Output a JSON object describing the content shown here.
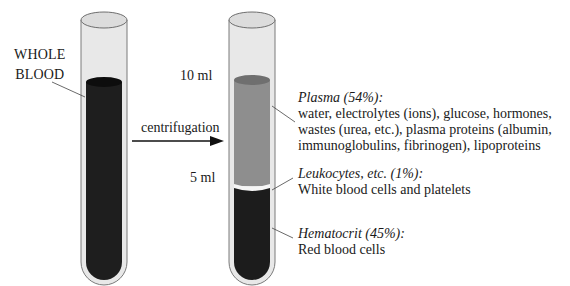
{
  "whole_blood_label": [
    "WHOLE",
    "BLOOD"
  ],
  "arrow_label": "centrifugation",
  "scale": {
    "top": "10 ml",
    "mid": "5 ml"
  },
  "layers": [
    {
      "title": "Plasma (54%):",
      "lines": [
        "water, electrolytes (ions), glucose, hormones,",
        "wastes (urea, etc.), plasma proteins (albumin,",
        "immunoglobulins, fibrinogen), lipoproteins"
      ],
      "color": "#8e8e8e"
    },
    {
      "title": "Leukocytes, etc. (1%):",
      "lines": [
        "White blood cells and platelets"
      ],
      "color": "#f2f2f2"
    },
    {
      "title": "Hematocrit (45%):",
      "lines": [
        "Red blood cells"
      ],
      "color": "#1c1c1c"
    }
  ],
  "colors": {
    "glass": "#e6e6e6",
    "glass_edge": "#7a7a7a",
    "whole_blood": "#1e1e1e"
  }
}
